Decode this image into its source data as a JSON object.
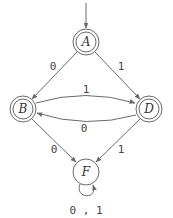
{
  "diagram": {
    "type": "finite-automaton",
    "colors": {
      "stroke": "#6a6a6a",
      "text": "#333333",
      "background": "#ffffff"
    },
    "start_state": "A",
    "states": [
      {
        "id": "A",
        "label": "A",
        "accepting": true,
        "x": 86,
        "y": 42
      },
      {
        "id": "B",
        "label": "B",
        "accepting": true,
        "x": 23,
        "y": 109
      },
      {
        "id": "D",
        "label": "D",
        "accepting": true,
        "x": 149,
        "y": 109
      },
      {
        "id": "F",
        "label": "F",
        "accepting": false,
        "x": 86,
        "y": 172
      }
    ],
    "transitions": [
      {
        "from": "A",
        "to": "B",
        "label": "0"
      },
      {
        "from": "A",
        "to": "D",
        "label": "1"
      },
      {
        "from": "B",
        "to": "D",
        "label": "1"
      },
      {
        "from": "D",
        "to": "B",
        "label": "0"
      },
      {
        "from": "B",
        "to": "F",
        "label": "0"
      },
      {
        "from": "D",
        "to": "F",
        "label": "1"
      },
      {
        "from": "F",
        "to": "F",
        "label": "0,1"
      }
    ],
    "labels": {
      "A_B": "0",
      "A_D": "1",
      "B_D": "1",
      "D_B": "0",
      "B_F": "0",
      "D_F": "1",
      "F_F": "0 , 1"
    }
  }
}
